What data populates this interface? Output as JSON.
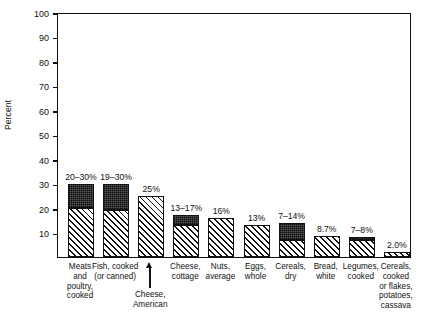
{
  "chart_data": {
    "type": "bar",
    "title": "",
    "subtitle": "",
    "xlabel": "",
    "ylabel": "Percent",
    "ylim": [
      0,
      100
    ],
    "yticks": [
      0,
      10,
      20,
      30,
      40,
      50,
      60,
      70,
      80,
      90,
      100
    ],
    "ytick_labels": [
      "",
      "10",
      "20",
      "30",
      "40",
      "50",
      "60",
      "70",
      "80",
      "90",
      "100"
    ],
    "grid": false,
    "legend": false,
    "legend_position": "none",
    "stacked": true,
    "series": [
      {
        "name": "lower-range",
        "pattern": "diagonal-hatch",
        "values": [
          20,
          19,
          25,
          13,
          16,
          13,
          7,
          8.7,
          7,
          2.0
        ]
      },
      {
        "name": "upper-range",
        "pattern": "dark-stipple",
        "values": [
          10,
          11,
          0,
          4,
          0,
          0,
          7,
          0,
          1,
          0
        ]
      }
    ],
    "categories": [
      "Meats and poultry, cooked",
      "Fish, cooked (or canned)",
      "Cheese, American",
      "Cheese, cottage",
      "Nuts, average",
      "Eggs, whole",
      "Cereals, dry",
      "Bread, white",
      "Legumes, cooked",
      "Cereals, cooked or flakes, potatoes, cassava"
    ],
    "bars": [
      {
        "category_lines": [
          "Meats",
          "and",
          "poultry,",
          "cooked"
        ],
        "label": "20–30%",
        "total": 30,
        "lower": 20,
        "upper": 30,
        "label_below": false,
        "pointer": false
      },
      {
        "category_lines": [
          "Fish, cooked",
          "(or canned)"
        ],
        "label": "19–30%",
        "total": 30,
        "lower": 19,
        "upper": 30,
        "label_below": false,
        "pointer": false
      },
      {
        "category_lines": [
          "Cheese,",
          "American"
        ],
        "label": "25%",
        "total": 25,
        "lower": 25,
        "upper": 25,
        "label_below": true,
        "pointer": true
      },
      {
        "category_lines": [
          "Cheese,",
          "cottage"
        ],
        "label": "13–17%",
        "total": 17,
        "lower": 13,
        "upper": 17,
        "label_below": false,
        "pointer": false
      },
      {
        "category_lines": [
          "Nuts,",
          "average"
        ],
        "label": "16%",
        "total": 16,
        "lower": 16,
        "upper": 16,
        "label_below": false,
        "pointer": false
      },
      {
        "category_lines": [
          "Eggs,",
          "whole"
        ],
        "label": "13%",
        "total": 13,
        "lower": 13,
        "upper": 13,
        "label_below": false,
        "pointer": false
      },
      {
        "category_lines": [
          "Cereals,",
          "dry"
        ],
        "label": "7–14%",
        "total": 14,
        "lower": 7,
        "upper": 14,
        "label_below": false,
        "pointer": false
      },
      {
        "category_lines": [
          "Bread,",
          "white"
        ],
        "label": "8.7%",
        "total": 8.7,
        "lower": 8.7,
        "upper": 8.7,
        "label_below": false,
        "pointer": false
      },
      {
        "category_lines": [
          "Legumes,",
          "cooked"
        ],
        "label": "7–8%",
        "total": 8,
        "lower": 7,
        "upper": 8,
        "label_below": false,
        "pointer": false
      },
      {
        "category_lines": [
          "Cereals,",
          "cooked",
          "or flakes,",
          "potatoes,",
          "cassava"
        ],
        "label": "2.0%",
        "total": 2.0,
        "lower": 2.0,
        "upper": 2.0,
        "label_below": false,
        "pointer": false
      }
    ]
  }
}
